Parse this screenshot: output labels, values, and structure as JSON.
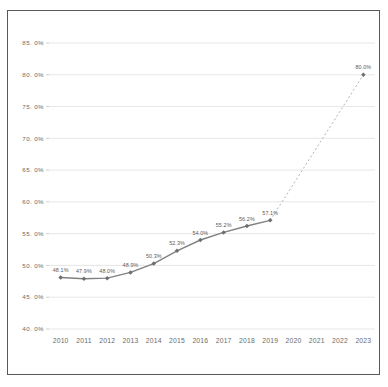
{
  "chart_data": {
    "type": "line",
    "title": "",
    "subtitle": "",
    "xlabel": "",
    "ylabel": "",
    "categories": [
      "2010",
      "2011",
      "2012",
      "2013",
      "2014",
      "2015",
      "2016",
      "2017",
      "2018",
      "2019",
      "2020",
      "2021",
      "2022",
      "2023"
    ],
    "ylim": [
      40.0,
      85.0
    ],
    "ytick_step": 5.0,
    "ytick_labels": [
      "85. 0%",
      "80. 0%",
      "75. 0%",
      "70. 0%",
      "65. 0%",
      "60. 0%",
      "55. 0%",
      "50. 0%",
      "45. 0%",
      "40. 0%"
    ],
    "ytick_values": [
      85.0,
      80.0,
      75.0,
      70.0,
      65.0,
      60.0,
      55.0,
      50.0,
      45.0,
      40.0
    ],
    "grid": true,
    "grid_axis": "y",
    "legend": false,
    "legend_position": "none",
    "series": [
      {
        "name": "actual",
        "style": "solid",
        "markers": true,
        "x": [
          "2010",
          "2011",
          "2012",
          "2013",
          "2014",
          "2015",
          "2016",
          "2017",
          "2018",
          "2019"
        ],
        "values": [
          48.1,
          47.9,
          48.0,
          48.9,
          50.3,
          52.3,
          54.0,
          55.2,
          56.2,
          57.1
        ],
        "labels": [
          "48.1%",
          "47.9%",
          "48.0%",
          "48.9%",
          "50.3%",
          "52.3%",
          "54.0%",
          "55.2%",
          "56.2%",
          "57.1%"
        ]
      },
      {
        "name": "projection",
        "style": "dotted",
        "markers": true,
        "x": [
          "2019",
          "2023"
        ],
        "values": [
          57.1,
          80.0
        ],
        "labels": [
          "",
          "80.0%"
        ]
      }
    ],
    "colors": {
      "line": "#808080",
      "projection_line": "#a8a8a8",
      "marker": "#6e6e6e",
      "grid": "#e4e4e4",
      "axis": "#c9c9c9",
      "text": "#6b6b6b",
      "label_text": "#5a5a5a",
      "frame": "#595959",
      "background": "#ffffff"
    }
  }
}
